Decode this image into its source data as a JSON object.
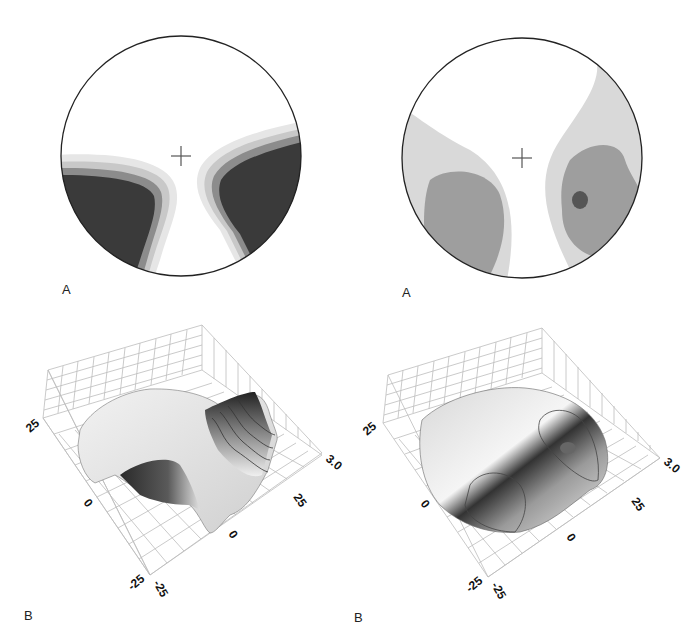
{
  "figure": {
    "panels": [
      {
        "id": "top-left",
        "label": "A",
        "type": "2D contour map (circular field)",
        "marker": "crosshair-center",
        "colors": {
          "level1": "#e6e6e6",
          "level2": "#c8c8c8",
          "level3": "#8c8c8c",
          "level4": "#3a3a3a",
          "outline": "#222222"
        }
      },
      {
        "id": "top-right",
        "label": "A",
        "type": "2D contour map (circular field)",
        "marker": "crosshair-center",
        "colors": {
          "level1": "#d9d9d9",
          "level2": "#9e9e9e",
          "level3": "#555555",
          "outline": "#222222"
        }
      },
      {
        "id": "bottom-left",
        "label": "B",
        "type": "3D surface plot",
        "axis_ticks": {
          "left_axis": [
            "25",
            "0",
            "-25"
          ],
          "right_axis": [
            "-25",
            "0",
            "25"
          ],
          "z_axis_max": "3.0"
        }
      },
      {
        "id": "bottom-right",
        "label": "B",
        "type": "3D surface plot",
        "axis_ticks": {
          "left_axis": [
            "25",
            "0",
            "-25"
          ],
          "right_axis": [
            "-25",
            "0",
            "25"
          ],
          "z_axis_max": "3.0"
        }
      }
    ]
  }
}
